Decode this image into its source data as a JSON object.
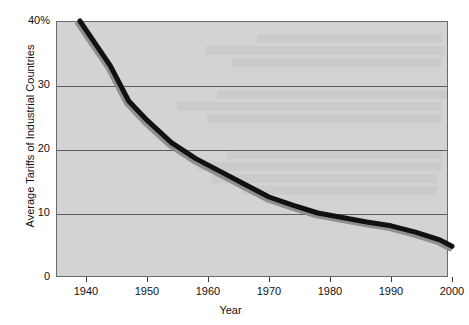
{
  "chart_data": {
    "type": "line",
    "title": "",
    "xlabel": "Year",
    "ylabel": "Average Tariffs of Industrial Countries",
    "xlim": [
      1939,
      2004
    ],
    "ylim": [
      0,
      40
    ],
    "grid": true,
    "legend": "none",
    "x_ticks": [
      "1940",
      "1950",
      "1960",
      "1970",
      "1980",
      "1990",
      "2000"
    ],
    "x_tick_values": [
      1940,
      1950,
      1960,
      1970,
      1980,
      1990,
      2000
    ],
    "y_ticks": [
      "0",
      "10",
      "20",
      "30",
      "40%"
    ],
    "y_tick_values": [
      0,
      10,
      20,
      30,
      40
    ],
    "series": [
      {
        "name": "Average Tariffs of Industrial Countries",
        "color": "#111111",
        "shadow_color": "#8f8f8f",
        "line_width": 5,
        "x": [
          1939,
          1944,
          1947,
          1950,
          1954,
          1958,
          1962,
          1966,
          1970,
          1974,
          1978,
          1982,
          1986,
          1990,
          1994,
          1998,
          2000
        ],
        "values": [
          40.0,
          33.0,
          27.5,
          24.5,
          21.0,
          18.5,
          16.5,
          14.5,
          12.5,
          11.2,
          10.0,
          9.3,
          8.6,
          8.0,
          7.0,
          5.8,
          4.8
        ]
      }
    ],
    "plot_background": "#d3d3d3",
    "gridline_color": "#5d5d5d",
    "frame_color": "#6a6a6a",
    "page_background": "#ffffff"
  },
  "annotations": {
    "bleed_through_note": ""
  }
}
